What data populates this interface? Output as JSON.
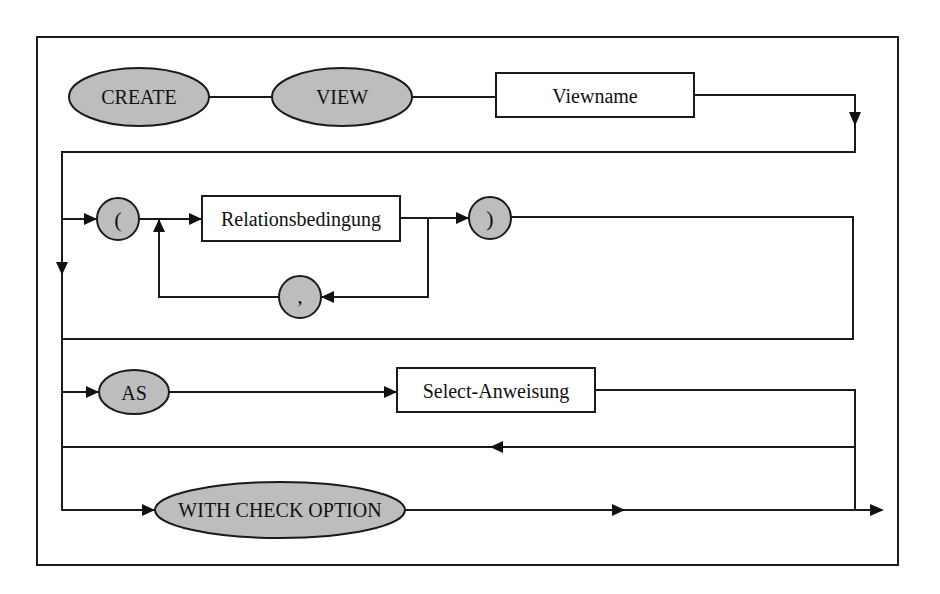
{
  "diagram": {
    "type": "syntax-diagram",
    "colors": {
      "terminal_fill": "#bdbdbd",
      "nonterminal_fill": "#ffffff",
      "stroke": "#1a1a1a",
      "background": "#ffffff"
    },
    "terminals": {
      "create": "CREATE",
      "view": "VIEW",
      "open_paren": "(",
      "comma": ",",
      "close_paren": ")",
      "as": "AS",
      "with_check_option": "WITH CHECK OPTION"
    },
    "nonterminals": {
      "viewname": "Viewname",
      "relationsbedingung": "Relationsbedingung",
      "select_anweisung": "Select-Anweisung"
    }
  }
}
